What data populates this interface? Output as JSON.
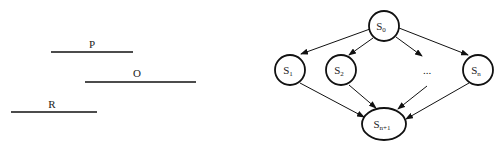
{
  "left_figure": {
    "segments": [
      {
        "label": "P",
        "x1": 51,
        "x2": 133,
        "y": 52
      },
      {
        "label": "O",
        "x1": 85,
        "x2": 196,
        "y": 82
      },
      {
        "label": "R",
        "x1": 11,
        "x2": 97,
        "y": 112
      }
    ]
  },
  "right_figure": {
    "nodes": {
      "s0": {
        "label": "S",
        "sub": "0"
      },
      "s1": {
        "label": "S",
        "sub": "1"
      },
      "s2": {
        "label": "S",
        "sub": "2"
      },
      "sn": {
        "label": "S",
        "sub": "n"
      },
      "sn1": {
        "label": "S",
        "sub": "n+1"
      }
    },
    "ellipsis": "...",
    "edges": [
      [
        "S0",
        "S1"
      ],
      [
        "S0",
        "S2"
      ],
      [
        "S0",
        "..."
      ],
      [
        "S0",
        "Sn"
      ],
      [
        "S1",
        "Sn+1"
      ],
      [
        "S2",
        "Sn+1"
      ],
      [
        "...",
        "Sn+1"
      ],
      [
        "Sn",
        "Sn+1"
      ]
    ]
  },
  "colors": {
    "stroke": "#111111",
    "text": "#222222"
  }
}
